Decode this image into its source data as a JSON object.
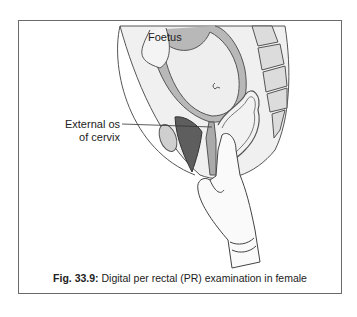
{
  "figure": {
    "labels": {
      "foetus": "Foetus",
      "external_os_line1": "External os",
      "external_os_line2": "of cervix"
    },
    "caption": {
      "number": "Fig. 33.9:",
      "text": "Digital per rectal (PR) examination in female"
    }
  },
  "colors": {
    "frame_border": "#6a6a6a",
    "tissue_light": "#eeeeee",
    "tissue_mid": "#b5b5b5",
    "tissue_dark": "#5a5a5a",
    "outline": "#444444"
  }
}
